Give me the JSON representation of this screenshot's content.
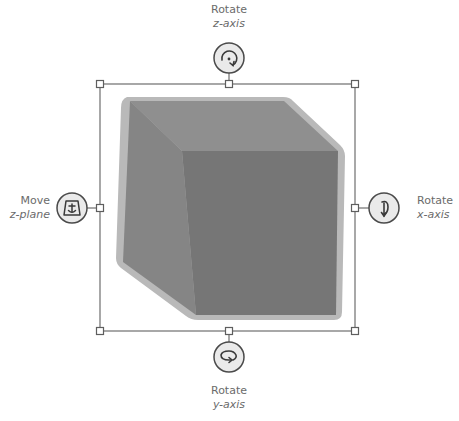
{
  "colors": {
    "background": "#ffffff",
    "frame_line": "#6e6e6e",
    "handle_fill": "#ffffff",
    "control_fill": "#eaeaea",
    "control_stroke": "#4a4a4a",
    "cube_outline": "#b9b9b9",
    "cube_top": "#8f8f8f",
    "cube_left": "#858585",
    "cube_front": "#767676",
    "label_text": "#6b6b6b"
  },
  "controls": {
    "top": {
      "verb": "Rotate",
      "axis": "z-axis",
      "icon": "rotate-z-icon"
    },
    "left": {
      "verb": "Move",
      "axis": "z-plane",
      "icon": "move-z-plane-icon"
    },
    "right": {
      "verb": "Rotate",
      "axis": "x-axis",
      "icon": "rotate-x-icon"
    },
    "bottom": {
      "verb": "Rotate",
      "axis": "y-axis",
      "icon": "rotate-y-icon"
    }
  },
  "selection": {
    "object": "3D cube",
    "handles": [
      "top-left",
      "top-middle",
      "top-right",
      "middle-left",
      "middle-right",
      "bottom-left",
      "bottom-middle",
      "bottom-right"
    ]
  }
}
